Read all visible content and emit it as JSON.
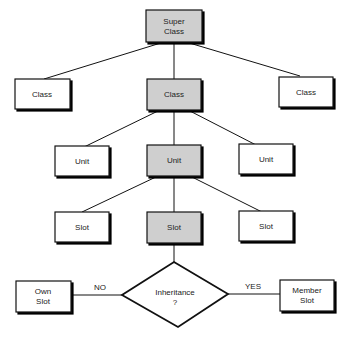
{
  "diagram": {
    "type": "class-hierarchy",
    "colors": {
      "highlight": "#cfcfcf",
      "plain": "#ffffff",
      "stroke": "#111111"
    },
    "nodes": {
      "superclass": {
        "line1": "Super",
        "line2": "Class",
        "highlighted": true
      },
      "class_left": {
        "label": "Class",
        "highlighted": false
      },
      "class_center": {
        "label": "Class",
        "highlighted": true
      },
      "class_right": {
        "label": "Class",
        "highlighted": false
      },
      "unit_left": {
        "label": "Unit",
        "highlighted": false
      },
      "unit_center": {
        "label": "Unit",
        "highlighted": true
      },
      "unit_right": {
        "label": "Unit",
        "highlighted": false
      },
      "slot_left": {
        "label": "Slot",
        "highlighted": false
      },
      "slot_center": {
        "label": "Slot",
        "highlighted": true
      },
      "slot_right": {
        "label": "Slot",
        "highlighted": false
      },
      "decision": {
        "line1": "Inheritance",
        "line2": "?"
      },
      "own_slot": {
        "line1": "Own",
        "line2": "Slot"
      },
      "member_slot": {
        "line1": "Member",
        "line2": "Slot"
      }
    },
    "edges": {
      "no_label": "NO",
      "yes_label": "YES"
    }
  }
}
